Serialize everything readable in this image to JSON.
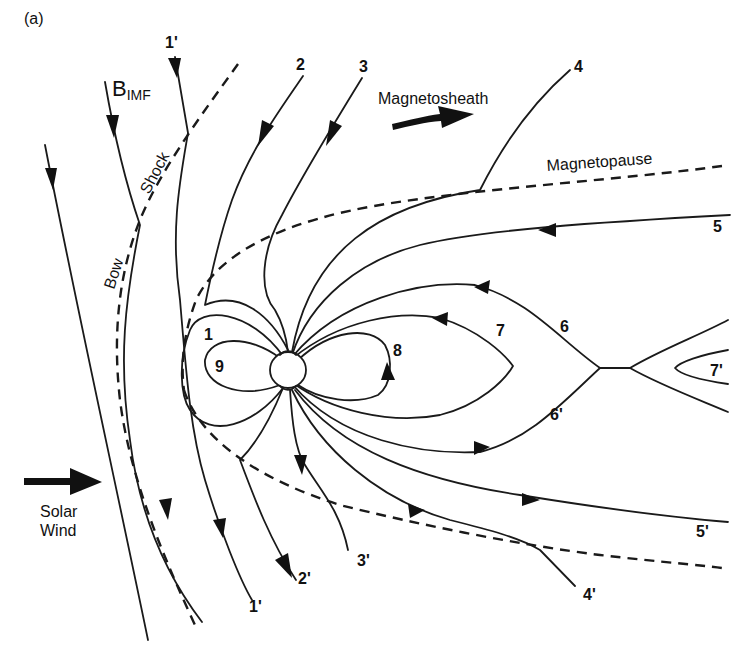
{
  "figure": {
    "panel_label": "(a)",
    "labels": {
      "b_imf": "B",
      "b_imf_sub": "IMF",
      "magnetosheath": "Magnetosheath",
      "magnetopause": "Magnetopause",
      "bow": "Bow",
      "shock": "Shock",
      "solar_wind_line1": "Solar",
      "solar_wind_line2": "Wind"
    },
    "field_line_labels": {
      "l1_top": "1'",
      "l2": "2",
      "l3": "3",
      "l4": "4",
      "l5": "5",
      "l6": "6",
      "l7": "7",
      "l8": "8",
      "l9": "9",
      "l1": "1",
      "l6p": "6'",
      "l7p": "7'",
      "l5p": "5'",
      "l4p": "4'",
      "l3p": "3'",
      "l2p": "2'",
      "l1p_bottom": "1'"
    },
    "colors": {
      "ink": "#111111",
      "background": "#ffffff"
    }
  }
}
